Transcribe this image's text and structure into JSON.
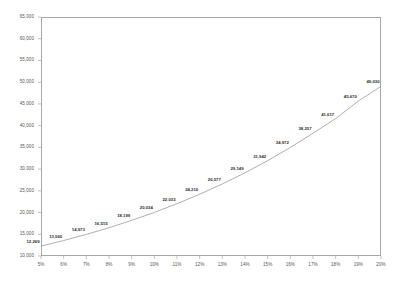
{
  "chart_data": {
    "type": "line",
    "title": "",
    "subtitle": "",
    "xlabel": "",
    "ylabel": "",
    "categories": [
      "5%",
      "6%",
      "7%",
      "8%",
      "9%",
      "10%",
      "11%",
      "12%",
      "13%",
      "14%",
      "15%",
      "16%",
      "17%",
      "18%",
      "19%",
      "20%"
    ],
    "x": [
      5,
      6,
      7,
      8,
      9,
      10,
      11,
      12,
      13,
      14,
      15,
      16,
      17,
      18,
      19,
      20
    ],
    "values": [
      12269,
      13560,
      14973,
      16515,
      18199,
      20034,
      22033,
      24210,
      26577,
      29149,
      31942,
      34972,
      38257,
      41617,
      45670,
      49030
    ],
    "point_labels": [
      "12,269",
      "13,560",
      "14,973",
      "16,515",
      "18,199",
      "20,034",
      "22,033",
      "24,210",
      "26,577",
      "29,149",
      "31,942",
      "34,972",
      "38,257",
      "41,617",
      "45,670",
      "49,030"
    ],
    "ylim": [
      10000,
      65000
    ],
    "xlim": [
      5,
      20
    ],
    "yticks": [
      10000,
      15000,
      20000,
      25000,
      30000,
      35000,
      40000,
      45000,
      50000,
      55000,
      60000,
      65000
    ],
    "ytick_labels": [
      "10,000",
      "15,000",
      "20,000",
      "25,000",
      "30,000",
      "35,000",
      "40,000",
      "45,000",
      "50,000",
      "55,000",
      "60,000",
      "65,000"
    ],
    "xticks": [
      5,
      6,
      7,
      8,
      9,
      10,
      11,
      12,
      13,
      14,
      15,
      16,
      17,
      18,
      19,
      20
    ],
    "xtick_labels": [
      "5%",
      "6%",
      "7%",
      "8%",
      "9%",
      "10%",
      "11%",
      "12%",
      "13%",
      "14%",
      "15%",
      "16%",
      "17%",
      "18%",
      "19%",
      "20%"
    ],
    "grid": false,
    "legend": false,
    "legend_position": "none",
    "line_color": "#8c8c8c",
    "axis_color": "#a8a8a8",
    "label_color": "#2b2b2b",
    "tick_color": "#575757",
    "background_color": "#ffffff",
    "series": [
      {
        "name": "series-1",
        "values": [
          12269,
          13560,
          14973,
          16515,
          18199,
          20034,
          22033,
          24210,
          26577,
          29149,
          31942,
          34972,
          38257,
          41617,
          45670,
          49030
        ]
      }
    ]
  }
}
